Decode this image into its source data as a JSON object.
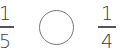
{
  "comparison": {
    "left_fraction": {
      "numerator": "1",
      "denominator": "5"
    },
    "answer_circle": {
      "value": ""
    },
    "right_fraction": {
      "numerator": "1",
      "denominator": "4"
    }
  }
}
